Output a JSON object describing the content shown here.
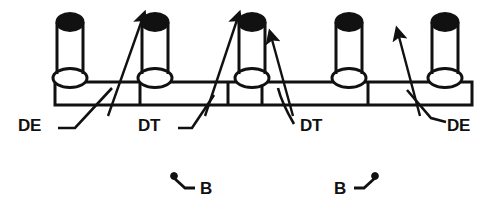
{
  "figure": {
    "background_color": "#ffffff",
    "ink_color": "#111111",
    "width": 498,
    "height": 217
  },
  "rail": {
    "name": "segmented-horizontal-rail",
    "x": 55,
    "y": 82,
    "width": 417,
    "height": 23,
    "stroke_width": 3,
    "divider_x": [
      140,
      228,
      262,
      368
    ]
  },
  "posts": [
    {
      "id": "post-1",
      "cx": 70,
      "top_y": 14,
      "base_y": 82,
      "body_width": 26,
      "cap_color": "#111111",
      "base_color": "#ffffff"
    },
    {
      "id": "post-2",
      "cx": 155,
      "top_y": 14,
      "base_y": 82,
      "body_width": 26,
      "cap_color": "#111111",
      "base_color": "#ffffff"
    },
    {
      "id": "post-3",
      "cx": 252,
      "top_y": 14,
      "base_y": 82,
      "body_width": 26,
      "cap_color": "#111111",
      "base_color": "#ffffff"
    },
    {
      "id": "post-4",
      "cx": 349,
      "top_y": 14,
      "base_y": 82,
      "body_width": 26,
      "cap_color": "#111111",
      "base_color": "#ffffff"
    },
    {
      "id": "post-5",
      "cx": 445,
      "top_y": 14,
      "base_y": 82,
      "body_width": 26,
      "cap_color": "#111111",
      "base_color": "#ffffff"
    }
  ],
  "arrows": [
    {
      "id": "arrow-1",
      "x1": 108,
      "y1": 116,
      "x2": 143,
      "y2": 17,
      "points_to": "post-2"
    },
    {
      "id": "arrow-2",
      "x1": 205,
      "y1": 116,
      "x2": 238,
      "y2": 17,
      "points_to": "post-3"
    },
    {
      "id": "arrow-3",
      "x1": 293,
      "y1": 116,
      "x2": 271,
      "y2": 36,
      "points_to": "post-3"
    },
    {
      "id": "arrow-4",
      "x1": 420,
      "y1": 116,
      "x2": 398,
      "y2": 33,
      "points_to": "post-5"
    }
  ],
  "callouts": [
    {
      "id": "callout-de-left",
      "label": "DE",
      "label_x": 18,
      "label_y": 131,
      "leader": "M 58 128 L 75 128 L 110 90"
    },
    {
      "id": "callout-dt-left",
      "label": "DT",
      "label_x": 138,
      "label_y": 131,
      "leader": "M 178 128 L 190 128 L 212 97"
    },
    {
      "id": "callout-dt-right",
      "label": "DT",
      "label_x": 300,
      "label_y": 131,
      "leader": "M 293 124 C 286 112 280 100 277 90"
    },
    {
      "id": "callout-de-right",
      "label": "DE",
      "label_x": 447,
      "label_y": 131,
      "leader": "M 444 122 L 432 118 L 408 92"
    }
  ],
  "b_symbols": [
    {
      "id": "b-symbol-left",
      "label": "B",
      "label_x": 198,
      "label_y": 193,
      "dot_x": 174,
      "dot_y": 176,
      "elbow": "M 174 177 L 184 187 L 194 187",
      "dot_side": "left"
    },
    {
      "id": "b-symbol-right",
      "label": "B",
      "label_x": 338,
      "label_y": 193,
      "dot_x": 375,
      "dot_y": 176,
      "elbow": "M 375 177 L 364 187 L 354 187",
      "dot_side": "right"
    }
  ]
}
